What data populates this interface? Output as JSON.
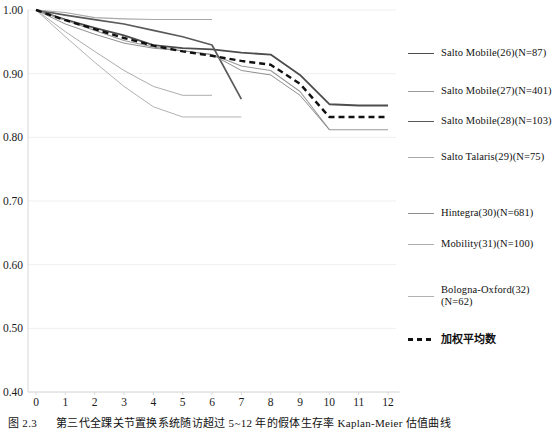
{
  "caption": {
    "figure_number": "图 2.3",
    "text": "第三代全踝关节置换系统随访超过 5~12 年的假体生存率 Kaplan-Meier 估值曲线"
  },
  "chart_data": {
    "type": "line",
    "title": "",
    "xlabel": "",
    "ylabel": "",
    "xlim": [
      0,
      12
    ],
    "ylim": [
      0.4,
      1.0
    ],
    "grid": true,
    "legend_position": "right",
    "x_ticks": [
      "0",
      "1",
      "2",
      "3",
      "4",
      "5",
      "6",
      "7",
      "8",
      "9",
      "10",
      "11",
      "12"
    ],
    "y_ticks": [
      "0.40",
      "0.50",
      "0.60",
      "0.70",
      "0.80",
      "0.90",
      "1.00"
    ],
    "series": [
      {
        "name": "Salto Mobile(26)(N=87)",
        "color": "#4d4d4d",
        "width": 1.8,
        "dash": "none",
        "x": [
          0,
          1,
          2,
          3,
          4,
          5,
          6,
          7,
          8,
          9,
          10,
          11,
          12
        ],
        "y": [
          1.0,
          0.985,
          0.972,
          0.96,
          0.945,
          0.94,
          0.938,
          0.933,
          0.93,
          0.898,
          0.852,
          0.85,
          0.85
        ]
      },
      {
        "name": "Salto Mobile(27)(N=401)",
        "color": "#9a9a9a",
        "width": 1.1,
        "dash": "none",
        "x": [
          0,
          1,
          2,
          3,
          4,
          5,
          6,
          7,
          8,
          9,
          10,
          11,
          12
        ],
        "y": [
          1.0,
          0.984,
          0.968,
          0.952,
          0.942,
          0.936,
          0.93,
          0.912,
          0.905,
          0.872,
          0.812,
          0.812,
          0.812
        ]
      },
      {
        "name": "Salto Mobile(28)(N=103)",
        "color": "#5a5a5a",
        "width": 1.7,
        "dash": "none",
        "x": [
          0,
          1,
          2,
          3,
          4,
          5,
          6,
          7
        ],
        "y": [
          1.0,
          0.992,
          0.985,
          0.978,
          0.968,
          0.958,
          0.945,
          0.86
        ]
      },
      {
        "name": "Salto Talaris(29)(N=75)",
        "color": "#a8a8a8",
        "width": 1.1,
        "dash": "none",
        "x": [
          0,
          1,
          2,
          3,
          4,
          5,
          6
        ],
        "y": [
          1.0,
          0.996,
          0.988,
          0.986,
          0.985,
          0.985,
          0.985
        ]
      },
      {
        "name": "Hintegra(30)(N=681)",
        "color": "#8f8f8f",
        "width": 1.0,
        "dash": "none",
        "x": [
          0,
          1,
          2,
          3,
          4,
          5,
          6,
          7,
          8,
          9,
          10
        ],
        "y": [
          1.0,
          0.978,
          0.962,
          0.948,
          0.94,
          0.936,
          0.93,
          0.905,
          0.898,
          0.866,
          0.812
        ]
      },
      {
        "name": "Mobility(31)(N=100)",
        "color": "#adadad",
        "width": 1.0,
        "dash": "none",
        "x": [
          0,
          1,
          2,
          3,
          4,
          5,
          6
        ],
        "y": [
          1.0,
          0.966,
          0.935,
          0.905,
          0.88,
          0.866,
          0.866
        ]
      },
      {
        "name": "Bologna-Oxford(32)(N=62)",
        "color": "#b2b2b2",
        "width": 1.0,
        "dash": "none",
        "x": [
          0,
          1,
          2,
          3,
          4,
          5,
          6,
          7
        ],
        "y": [
          1.0,
          0.958,
          0.918,
          0.88,
          0.848,
          0.832,
          0.832,
          0.832
        ]
      },
      {
        "name": "加权平均数",
        "color": "#111111",
        "width": 2.4,
        "dash": "6,4",
        "x": [
          0,
          1,
          2,
          3,
          4,
          5,
          6,
          7,
          8,
          9,
          10,
          11,
          12
        ],
        "y": [
          1.0,
          0.984,
          0.97,
          0.956,
          0.944,
          0.935,
          0.928,
          0.92,
          0.914,
          0.884,
          0.832,
          0.832,
          0.832
        ]
      }
    ]
  },
  "legend": {
    "items": [
      {
        "label": "Salto Mobile(26)(N=87)",
        "color": "#4d4d4d",
        "width": "1.8px",
        "style": "solid",
        "cjk": false
      },
      {
        "label": "Salto Mobile(27)(N=401)",
        "color": "#9a9a9a",
        "width": "1.1px",
        "style": "solid",
        "cjk": false
      },
      {
        "label": "Salto Mobile(28)(N=103)",
        "color": "#5a5a5a",
        "width": "1.8px",
        "style": "solid",
        "cjk": false
      },
      {
        "label": "Salto Talaris(29)(N=75)",
        "color": "#a8a8a8",
        "width": "1.1px",
        "style": "solid",
        "cjk": false
      },
      {
        "label": "Hintegra(30)(N=681)",
        "color": "#8f8f8f",
        "width": "1.0px",
        "style": "solid",
        "cjk": false
      },
      {
        "label": "Mobility(31)(N=100)",
        "color": "#adadad",
        "width": "1.0px",
        "style": "solid",
        "cjk": false
      },
      {
        "label": "Bologna-Oxford(32)(N=62)",
        "color": "#b2b2b2",
        "width": "1.0px",
        "style": "solid",
        "cjk": false
      },
      {
        "label": "加权平均数",
        "color": "#111111",
        "width": "2.6px",
        "style": "dashed",
        "cjk": true
      }
    ],
    "y_positions": [
      52,
      90,
      120,
      156,
      212,
      243,
      295,
      338
    ]
  },
  "axes": {
    "grid_color": "#efefef",
    "axis_color": "#d8d8d8"
  }
}
